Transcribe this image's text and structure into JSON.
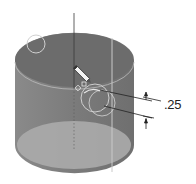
{
  "diagram": {
    "type": "cad-cylinder-sketch",
    "dimension": {
      "value": ".25",
      "position": {
        "x": 165,
        "y": 96
      }
    },
    "colors": {
      "background": "#ffffff",
      "cylinder_body": "#7a7a7a",
      "top_face": "#6e6e6e",
      "bottom_face": "#a9a9a9",
      "rim_highlight": "#c8c8c8",
      "axis_line": "#3a3a3a",
      "dimension_line": "#222222"
    },
    "elements": [
      {
        "name": "cylinder",
        "label": ""
      },
      {
        "name": "center-axis",
        "label": ""
      },
      {
        "name": "sketch-circle-top-left",
        "label": ""
      },
      {
        "name": "sketch-circle-center",
        "label": ""
      },
      {
        "name": "pencil-cursor",
        "label": ""
      },
      {
        "name": "dimension-callout",
        "label": ".25"
      }
    ]
  }
}
